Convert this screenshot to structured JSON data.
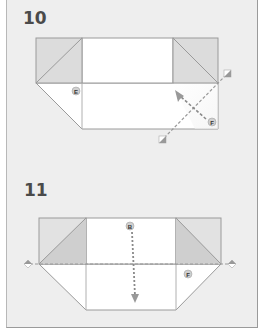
{
  "steps": [
    {
      "number": "10",
      "labels": {
        "e": "E",
        "f": "F"
      }
    },
    {
      "number": "11",
      "labels": {
        "b": "B",
        "f": "F"
      }
    }
  ],
  "colors": {
    "panel_bg": "#eeeeee",
    "paper_white": "#ffffff",
    "paper_shaded": "#dddddd",
    "paper_shaded_dark": "#cfcfcf",
    "edge": "#9a9a9a",
    "fold_line": "#999999",
    "arrow": "#8a8a8a"
  }
}
